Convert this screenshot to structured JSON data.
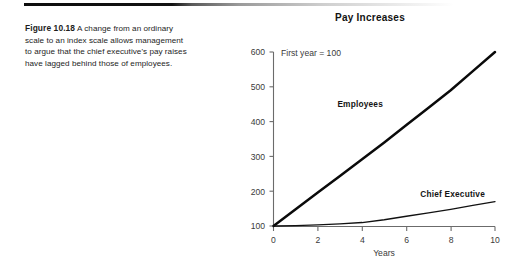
{
  "page": {
    "background_color": "#ffffff",
    "rule_color": "#0d0d0d"
  },
  "caption": {
    "figure_label": "Figure 10.18",
    "text": "A change from an ordinary scale to an index scale allows management to argue that the chief executive's pay raises have lagged behind those of employees."
  },
  "chart_data": {
    "type": "line",
    "title": "Pay Increases",
    "annotation": "First year = 100",
    "xlabel": "Years",
    "ylabel": "",
    "x": [
      0,
      1,
      2,
      3,
      4,
      5,
      6,
      7,
      8,
      9,
      10
    ],
    "xticks": [
      "0",
      "2",
      "4",
      "6",
      "8",
      "10"
    ],
    "xtick_values": [
      0,
      2,
      4,
      6,
      8,
      10
    ],
    "yticks": [
      "100",
      "200",
      "300",
      "400",
      "500",
      "600"
    ],
    "ytick_values": [
      100,
      200,
      300,
      400,
      500,
      600
    ],
    "xlim": [
      0,
      10
    ],
    "ylim": [
      100,
      600
    ],
    "grid": false,
    "legend_position": "inline-labels",
    "series": [
      {
        "name": "Employees",
        "color": "#0a0a0a",
        "line_width": 2.5,
        "values": [
          100,
          148,
          196,
          244,
          292,
          340,
          390,
          440,
          490,
          545,
          600
        ]
      },
      {
        "name": "Chief Executive",
        "color": "#111111",
        "line_width": 1.3,
        "values": [
          100,
          101,
          103,
          106,
          110,
          118,
          128,
          138,
          148,
          159,
          170
        ]
      }
    ]
  }
}
